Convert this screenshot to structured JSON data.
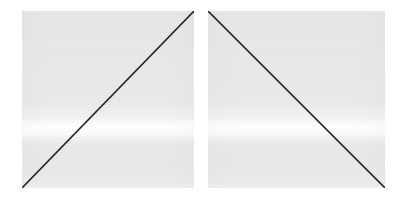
{
  "figure": {
    "background_color": "#ffffff",
    "width": 402,
    "height": 200,
    "panel_count": 2
  },
  "chart_data": {
    "type": "line",
    "title": "",
    "subtitle": "",
    "xlabel": "",
    "ylabel": "",
    "grid": false,
    "legend": null,
    "axis_ticks_visible": false,
    "axis_labels_visible": false,
    "panels": [
      {
        "name": "left-panel",
        "position": "left",
        "x": 22,
        "y": 11,
        "width": 172,
        "height": 177,
        "background_color": "#e9e9e9",
        "band_color": "#fdfdfd",
        "band_y_fraction": 0.655,
        "series": [
          {
            "name": "ascending-sweep",
            "color": "#2b2b2b",
            "line_width": 1.6,
            "x": [
              0,
              1
            ],
            "y": [
              0,
              1
            ],
            "start_point": [
              0,
              0
            ],
            "end_point": [
              1,
              1
            ],
            "direction": "bottom-left-to-top-right",
            "slope": "positive"
          }
        ]
      },
      {
        "name": "right-panel",
        "position": "right",
        "x": 208,
        "y": 11,
        "width": 177,
        "height": 177,
        "background_color": "#e9e9e9",
        "band_color": "#fdfdfd",
        "band_y_fraction": 0.655,
        "series": [
          {
            "name": "descending-sweep",
            "color": "#2b2b2b",
            "line_width": 1.6,
            "x": [
              0,
              1
            ],
            "y": [
              1,
              0
            ],
            "start_point": [
              0,
              1
            ],
            "end_point": [
              1,
              0
            ],
            "direction": "top-left-to-bottom-right",
            "slope": "negative"
          }
        ]
      }
    ]
  }
}
